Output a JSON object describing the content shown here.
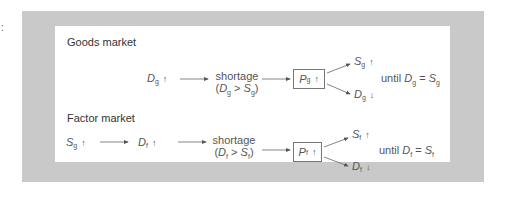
{
  "stray_mark": ":",
  "goods": {
    "title": "Goods market",
    "start": {
      "sym": "D",
      "sub": "g",
      "arrow": "↑"
    },
    "shortage_label": "shortage",
    "condition": {
      "lhs": "D",
      "lhs_sub": "g",
      "op": ">",
      "rhs": "S",
      "rhs_sub": "g"
    },
    "price": {
      "sym": "P",
      "sub": "g",
      "arrow": "↑"
    },
    "out_up": {
      "sym": "S",
      "sub": "g",
      "arrow": "↑"
    },
    "out_down": {
      "sym": "D",
      "sub": "g",
      "arrow": "↓"
    },
    "until": {
      "word": "until",
      "lhs": "D",
      "lhs_sub": "g",
      "op": "=",
      "rhs": "S",
      "rhs_sub": "g"
    }
  },
  "factor": {
    "title": "Factor market",
    "start": {
      "sym": "S",
      "sub": "g",
      "arrow": "↑"
    },
    "mid": {
      "sym": "D",
      "sub": "f",
      "arrow": "↑"
    },
    "shortage_label": "shortage",
    "condition": {
      "lhs": "D",
      "lhs_sub": "f",
      "op": ">",
      "rhs": "S",
      "rhs_sub": "f"
    },
    "price": {
      "sym": "P",
      "sub": "f",
      "arrow": "↑"
    },
    "out_up": {
      "sym": "S",
      "sub": "f",
      "arrow": "↑"
    },
    "out_down": {
      "sym": "D",
      "sub": "f",
      "arrow": "↓"
    },
    "until": {
      "word": "until",
      "lhs": "D",
      "lhs_sub": "f",
      "op": "=",
      "rhs": "S",
      "rhs_sub": "f"
    }
  },
  "colors": {
    "frame": "#c9c9c9",
    "panel": "#ffffff",
    "ink": "#555555"
  }
}
